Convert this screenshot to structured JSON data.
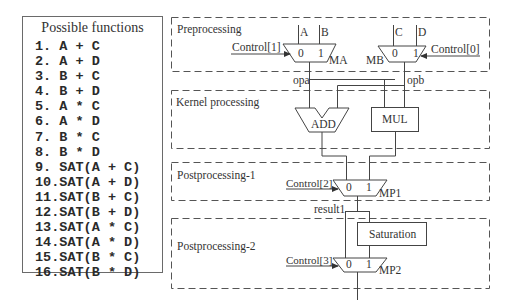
{
  "functions_panel": {
    "title": "Possible functions",
    "items": [
      "1. A + C",
      "2. A + D",
      "3. B + C",
      "4. B + D",
      "5. A * C",
      "6. A * D",
      "7. B * C",
      "8. B * D",
      "9. SAT(A + C)",
      "10.SAT(A + D)",
      "11.SAT(B + C)",
      "12.SAT(B + D)",
      "13.SAT(A * C)",
      "14.SAT(A * D)",
      "15.SAT(B * C)",
      "16.SAT(B * D)"
    ]
  },
  "diagram": {
    "stages": {
      "preprocessing": "Preprocessing",
      "kernel": "Kernel processing",
      "post1": "Postprocessing-1",
      "post2": "Postprocessing-2"
    },
    "inputs": {
      "a": "A",
      "b": "B",
      "c": "C",
      "d": "D"
    },
    "muxes": {
      "ma": {
        "name": "MA",
        "control": "Control[1]",
        "in0": "0",
        "in1": "1"
      },
      "mb": {
        "name": "MB",
        "control": "Control[0]",
        "in0": "0",
        "in1": "1"
      },
      "mp1": {
        "name": "MP1",
        "control": "Control[2]",
        "in0": "0",
        "in1": "1"
      },
      "mp2": {
        "name": "MP2",
        "control": "Control[3]",
        "in0": "0",
        "in1": "1"
      }
    },
    "signals": {
      "opa": "opa",
      "opb": "opb",
      "result1": "result1"
    },
    "units": {
      "add": "ADD",
      "mul": "MUL",
      "saturation": "Saturation"
    },
    "colors": {
      "line": "#444444",
      "dash": "#555555",
      "text": "#333333"
    }
  }
}
